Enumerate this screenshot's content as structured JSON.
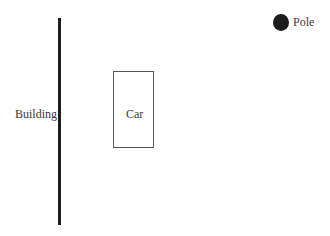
{
  "diagram": {
    "building": {
      "label": "Building"
    },
    "car": {
      "label": "Car"
    },
    "pole": {
      "label": "Pole"
    }
  }
}
